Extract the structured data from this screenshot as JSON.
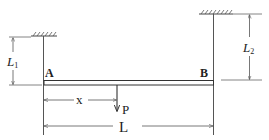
{
  "diagram": {
    "type": "beam-hanging-from-two-supports",
    "labels": {
      "end_left": "A",
      "end_right": "B",
      "length_left_hanger": "L",
      "length_left_hanger_sub": "1",
      "length_right_hanger": "L",
      "length_right_hanger_sub": "2",
      "load_position": "x",
      "load": "P",
      "beam_length": "L"
    },
    "colors": {
      "line": "#333333",
      "dim_line": "#555555",
      "text": "#222222",
      "background": "#ffffff"
    }
  }
}
